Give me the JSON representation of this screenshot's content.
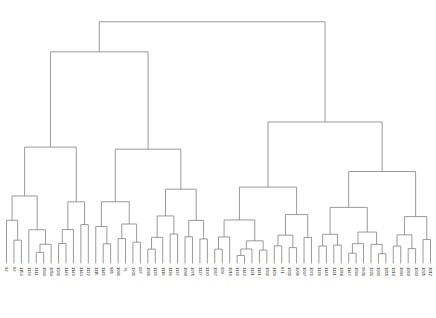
{
  "chart_data": {
    "type": "dendrogram",
    "title": "",
    "xlabel": "",
    "ylabel": "",
    "orientation": "vertical",
    "link_color": "#808080",
    "background": "#ffffff",
    "grid": false,
    "legend": null,
    "axis_visible": false,
    "n_leaves": 58,
    "height_range": [
      0,
      1.0
    ],
    "leaf_order": [
      "92",
      "82",
      "1153",
      "1133",
      "1111",
      "1044",
      "1054",
      "1041",
      "1146",
      "1149",
      "1144",
      "1122",
      "1115",
      "1145",
      "985",
      "1081",
      "76",
      "1201",
      "497",
      "1096",
      "1126",
      "1118",
      "1136",
      "1137",
      "1090",
      "1075",
      "1127",
      "1130",
      "1067",
      "909",
      "1016",
      "1139",
      "1142",
      "1131",
      "1141",
      "1042",
      "1109",
      "871",
      "1002",
      "1006",
      "1037",
      "1071",
      "1128",
      "1141b",
      "1048",
      "1121",
      "1058",
      "1147",
      "1094",
      "2601",
      "1221"
    ],
    "leaf_labels": [
      "92",
      "82",
      "1153",
      "1133",
      "1111",
      "1044",
      "1054",
      "1041",
      "1146",
      "1149",
      "1144",
      "1122",
      "1115",
      "1145",
      "985",
      "1081",
      "76",
      "1201",
      "497",
      "1096",
      "1126",
      "1118",
      "1136",
      "1137",
      "1090",
      "1075",
      "1127",
      "1130",
      "1067",
      "909",
      "1016",
      "1139",
      "1142",
      "1131",
      "1141",
      "1042",
      "1109",
      "871",
      "1002",
      "1006",
      "1037",
      "1071",
      "1128",
      "1148",
      "1121",
      "1058",
      "1147",
      "1094",
      "2601",
      "1221",
      "1003",
      "1055",
      "1019",
      "1083",
      "1060",
      "1033",
      "1025",
      "1012"
    ],
    "merges": [
      {
        "id": "root",
        "height": 0.965,
        "left_x": 180.0,
        "right_x": 375.0,
        "center_x": 277.5
      },
      {
        "id": "m-left-top",
        "height": 0.845,
        "left_x": 105.0,
        "right_x": 255.0,
        "center_x": 180.0
      },
      {
        "id": "m-right-top",
        "height": 0.565,
        "left_x": 320.0,
        "right_x": 411.0,
        "center_x": 375.0
      },
      {
        "id": "m-l2",
        "height": 0.53,
        "left_x": 68.0,
        "right_x": 140.0,
        "center_x": 105.0
      },
      {
        "id": "m-mid",
        "height": 0.455,
        "left_x": 228.0,
        "right_x": 281.0,
        "center_x": 255.0
      },
      {
        "id": "m-mid2",
        "height": 0.375,
        "left_x": 207.0,
        "right_x": 249.0,
        "center_x": 228.0
      },
      {
        "id": "m-r2",
        "height": 0.385,
        "left_x": 300.0,
        "right_x": 340.0,
        "center_x": 320.0
      },
      {
        "id": "m-l3",
        "height": 0.3,
        "left_x": 52.0,
        "right_x": 84.0,
        "center_x": 68.0
      },
      {
        "id": "m-l4",
        "height": 0.29,
        "left_x": 124.0,
        "right_x": 156.0,
        "center_x": 140.0
      }
    ]
  },
  "figure": {
    "caption": "",
    "axis_label": ""
  }
}
